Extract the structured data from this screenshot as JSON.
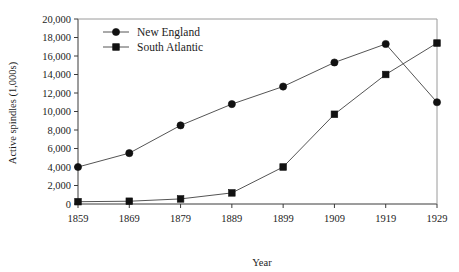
{
  "chart_data": {
    "type": "line",
    "title": "",
    "xlabel": "Year",
    "ylabel": "Active spindles (1,000s)",
    "x": [
      1859,
      1869,
      1879,
      1889,
      1899,
      1909,
      1919,
      1929
    ],
    "xticklabels": [
      "1859",
      "1869",
      "1879",
      "1889",
      "1899",
      "1909",
      "1919",
      "1929"
    ],
    "yticklabels": [
      "0",
      "2,000",
      "4,000",
      "6,000",
      "8,000",
      "10,000",
      "12,000",
      "14,000",
      "16,000",
      "18,000",
      "20,000"
    ],
    "yticks": [
      0,
      2000,
      4000,
      6000,
      8000,
      10000,
      12000,
      14000,
      16000,
      18000,
      20000
    ],
    "ylim": [
      0,
      20000
    ],
    "xlim": [
      1859,
      1929
    ],
    "grid": false,
    "legend_position": "top-left-inside",
    "series": [
      {
        "name": "New England",
        "marker": "circle",
        "color": "#111111",
        "values": [
          4000,
          5500,
          8500,
          10800,
          12700,
          15300,
          17300,
          11000
        ]
      },
      {
        "name": "South Atlantic",
        "marker": "square",
        "color": "#111111",
        "values": [
          250,
          300,
          550,
          1200,
          4000,
          9700,
          14000,
          17400
        ]
      }
    ]
  },
  "legend": {
    "items": [
      {
        "label": "New England"
      },
      {
        "label": "South Atlantic"
      }
    ]
  }
}
